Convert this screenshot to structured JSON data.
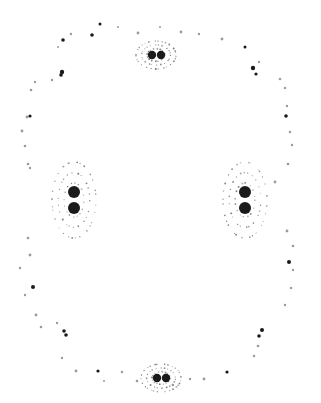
{
  "image": {
    "width": 321,
    "height": 403,
    "background": "#ffffff",
    "ink": "#1a1a1a",
    "faint": "#9a9a9a",
    "description": "Dot pattern on white: four clusters of paired dark blobs with dotted halos, connected by a dotted outer contour"
  },
  "blobs": [
    {
      "cx": 152,
      "cy": 55,
      "r": 4.2
    },
    {
      "cx": 161,
      "cy": 55,
      "r": 4.2
    },
    {
      "cx": 74,
      "cy": 192,
      "r": 6
    },
    {
      "cx": 74,
      "cy": 208,
      "r": 6
    },
    {
      "cx": 245,
      "cy": 192,
      "r": 6
    },
    {
      "cx": 245,
      "cy": 208,
      "r": 6
    },
    {
      "cx": 157,
      "cy": 378,
      "r": 4.2
    },
    {
      "cx": 166,
      "cy": 378,
      "r": 4.2
    }
  ],
  "halos": [
    {
      "cx": 156,
      "cy": 55,
      "rx": 20,
      "ry": 14
    },
    {
      "cx": 74,
      "cy": 200,
      "rx": 22,
      "ry": 38
    },
    {
      "cx": 245,
      "cy": 200,
      "rx": 22,
      "ry": 38
    },
    {
      "cx": 161,
      "cy": 378,
      "rx": 20,
      "ry": 14
    }
  ],
  "marks": [
    [
      100,
      24,
      1.5
    ],
    [
      118,
      27,
      1
    ],
    [
      138,
      33,
      1.4
    ],
    [
      160,
      27,
      1
    ],
    [
      181,
      32,
      1.4
    ],
    [
      199,
      34,
      1.2
    ],
    [
      222,
      39,
      1.4
    ],
    [
      245,
      47,
      1.5
    ],
    [
      71,
      34,
      1.2
    ],
    [
      63,
      40,
      1.8
    ],
    [
      58,
      47,
      1
    ],
    [
      92,
      35,
      1.8
    ],
    [
      62,
      72,
      2.2
    ],
    [
      61,
      75,
      1.8
    ],
    [
      52,
      80,
      1.2
    ],
    [
      35,
      82,
      1.2
    ],
    [
      31,
      90,
      1.3
    ],
    [
      27,
      117,
      1.4
    ],
    [
      30,
      116,
      1.6
    ],
    [
      22,
      131,
      1.4
    ],
    [
      25,
      146,
      1.3
    ],
    [
      28,
      164,
      1.3
    ],
    [
      30,
      168,
      1.2
    ],
    [
      253,
      68,
      2.2
    ],
    [
      256,
      74,
      1.6
    ],
    [
      259,
      62,
      1.2
    ],
    [
      280,
      79,
      1.3
    ],
    [
      285,
      88,
      1.2
    ],
    [
      287,
      106,
      1.2
    ],
    [
      286,
      116,
      1.8
    ],
    [
      290,
      132,
      1.2
    ],
    [
      292,
      145,
      1.2
    ],
    [
      288,
      164,
      1.3
    ],
    [
      275,
      182,
      1.4
    ],
    [
      28,
      238,
      1.3
    ],
    [
      30,
      255,
      1.4
    ],
    [
      20,
      268,
      1.2
    ],
    [
      33,
      287,
      2
    ],
    [
      25,
      295,
      1.2
    ],
    [
      36,
      315,
      1.4
    ],
    [
      41,
      327,
      1.3
    ],
    [
      64,
      331,
      1.8
    ],
    [
      66,
      335,
      1.8
    ],
    [
      57,
      323,
      1.2
    ],
    [
      62,
      358,
      1.2
    ],
    [
      76,
      371,
      1.4
    ],
    [
      98,
      371,
      1.6
    ],
    [
      122,
      372,
      1.2
    ],
    [
      137,
      381,
      1.3
    ],
    [
      104,
      381,
      1
    ],
    [
      287,
      231,
      1.4
    ],
    [
      293,
      246,
      1.3
    ],
    [
      289,
      262,
      2
    ],
    [
      293,
      270,
      1.2
    ],
    [
      291,
      288,
      1.2
    ],
    [
      285,
      305,
      1.2
    ],
    [
      262,
      330,
      2
    ],
    [
      259,
      336,
      1.8
    ],
    [
      258,
      346,
      1.3
    ],
    [
      254,
      356,
      1.2
    ],
    [
      227,
      372,
      1.6
    ],
    [
      204,
      379,
      1.4
    ],
    [
      190,
      379,
      1.2
    ],
    [
      173,
      385,
      1.2
    ]
  ],
  "halo_dot_color": "#5a5a5a"
}
